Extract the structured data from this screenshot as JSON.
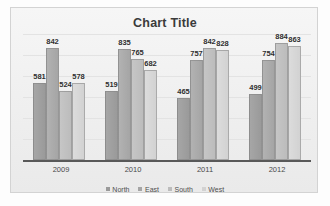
{
  "chart_data": {
    "type": "bar",
    "title": "Chart Title",
    "xlabel": "",
    "ylabel": "",
    "categories": [
      "2009",
      "2010",
      "2011",
      "2012"
    ],
    "series": [
      {
        "name": "North",
        "values": [
          581,
          519,
          465,
          499
        ]
      },
      {
        "name": "East",
        "values": [
          842,
          835,
          757,
          754
        ]
      },
      {
        "name": "South",
        "values": [
          524,
          765,
          842,
          884
        ]
      },
      {
        "name": "West",
        "values": [
          578,
          682,
          828,
          863
        ]
      }
    ],
    "ylim": [
      0,
      950
    ],
    "grid": true,
    "data_labels": true,
    "legend_position": "bottom",
    "colors": {
      "north": "#9a9a9a",
      "east": "#a5a5a5",
      "south": "#bcbcbc",
      "west": "#d2d2d2",
      "axis": "#595959",
      "grid": "#e3e3e3",
      "plot_background": "#f2f2f2",
      "title_text": "#3b3b3b"
    }
  }
}
